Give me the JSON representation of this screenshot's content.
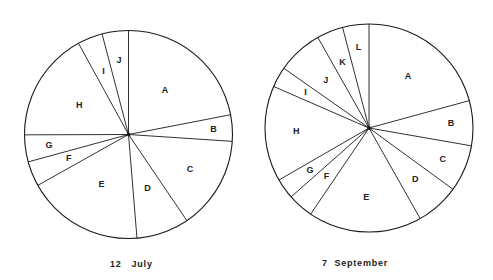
{
  "chart_data": [
    {
      "type": "pie",
      "title": "12 July",
      "start_angle": "12 o'clock",
      "direction": "clockwise",
      "legend": "none",
      "labels": [
        "A",
        "B",
        "C",
        "D",
        "E",
        "F",
        "G",
        "H",
        "I",
        "J"
      ],
      "values": [
        22.0,
        4.1,
        14.5,
        8.2,
        18.2,
        3.9,
        4.2,
        17.1,
        3.9,
        4.1
      ],
      "units": "percent (estimated from slice angles)"
    },
    {
      "type": "pie",
      "title": "7 September",
      "start_angle": "12 o'clock",
      "direction": "clockwise",
      "legend": "none",
      "labels": [
        "A",
        "B",
        "C",
        "D",
        "E",
        "F",
        "G",
        "H",
        "I",
        "J",
        "K",
        "L"
      ],
      "values": [
        20.8,
        7.0,
        7.3,
        6.8,
        17.7,
        4.0,
        3.2,
        14.9,
        3.2,
        7.1,
        4.1,
        4.1
      ],
      "units": "percent (estimated from slice angles)"
    }
  ],
  "captions": {
    "left": "12   July",
    "right": "7  September"
  },
  "style": {
    "stroke": "#1a1a1a",
    "fill": "#ffffff"
  }
}
